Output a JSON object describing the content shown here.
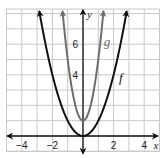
{
  "chart_data": {
    "type": "line",
    "title": "",
    "xlabel": "x",
    "ylabel": "y",
    "xlim": [
      -5,
      5
    ],
    "ylim": [
      -1,
      8.3
    ],
    "grid": true,
    "x_ticks": [
      -4,
      -2,
      2,
      4
    ],
    "x_tick_labels": [
      "−4",
      "−2",
      "2",
      "4"
    ],
    "y_ticks": [
      4,
      6
    ],
    "y_tick_labels": [
      "4",
      "6"
    ],
    "series": [
      {
        "name": "f",
        "label": "f",
        "equation": "f(x) = x^2",
        "a": 1,
        "k": 0,
        "color": "#111111",
        "label_pos": [
          2.35,
          3.5
        ],
        "points": [
          [
            -2.9,
            8.41
          ],
          [
            -2,
            4
          ],
          [
            -1,
            1
          ],
          [
            0,
            0
          ],
          [
            1,
            1
          ],
          [
            2,
            4
          ],
          [
            2.9,
            8.41
          ]
        ]
      },
      {
        "name": "g",
        "label": "g",
        "equation": "g(x) = 4x^2 + 1",
        "a": 4,
        "k": 1,
        "color": "#6e6e6e",
        "label_pos": [
          1.35,
          5.9
        ],
        "points": [
          [
            -1.3,
            7.76
          ],
          [
            -1,
            5
          ],
          [
            -0.5,
            2
          ],
          [
            0,
            1
          ],
          [
            0.5,
            2
          ],
          [
            1,
            5
          ],
          [
            1.3,
            7.76
          ]
        ]
      }
    ]
  },
  "axes": {
    "x_name": "x",
    "y_name": "y"
  },
  "colors": {
    "grid": "#c8c8c8",
    "axis": "#111111",
    "f": "#111111",
    "g": "#6e6e6e"
  }
}
